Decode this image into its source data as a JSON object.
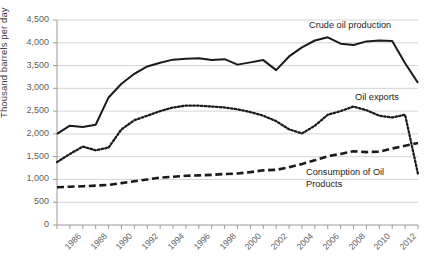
{
  "chart_data": {
    "type": "line",
    "title": "",
    "subtitle": "",
    "xlabel": "",
    "ylabel": "Thousand barrels per day",
    "ylim": [
      0,
      4500
    ],
    "xlim": [
      1985,
      2013
    ],
    "grid": true,
    "legend_position": "inline-annotations",
    "y_ticks": [
      "0",
      "500",
      "1,000",
      "1,500",
      "2,000",
      "2,500",
      "3,000",
      "3,500",
      "4,000",
      "4,500"
    ],
    "y_tick_values": [
      0,
      500,
      1000,
      1500,
      2000,
      2500,
      3000,
      3500,
      4000,
      4500
    ],
    "x_tick_labels": [
      "1986",
      "1988",
      "1990",
      "1992",
      "1994",
      "1996",
      "1998",
      "2000",
      "2002",
      "2004",
      "2006",
      "2008",
      "2010",
      "2012"
    ],
    "x_tick_values": [
      1986,
      1988,
      1990,
      1992,
      1994,
      1996,
      1998,
      2000,
      2002,
      2004,
      2006,
      2008,
      2010,
      2012
    ],
    "x": [
      1985,
      1986,
      1987,
      1988,
      1989,
      1990,
      1991,
      1992,
      1993,
      1994,
      1995,
      1996,
      1997,
      1998,
      1999,
      2000,
      2001,
      2002,
      2003,
      2004,
      2005,
      2006,
      2007,
      2008,
      2009,
      2010,
      2011,
      2012,
      2013
    ],
    "series": [
      {
        "name": "Crude oil production",
        "style": "solid",
        "color": "#1a1a1a",
        "annotation": "Crude oil production",
        "values": [
          2000,
          2180,
          2150,
          2200,
          2800,
          3100,
          3320,
          3480,
          3560,
          3630,
          3650,
          3660,
          3620,
          3640,
          3520,
          3570,
          3620,
          3400,
          3700,
          3900,
          4050,
          4120,
          3980,
          3950,
          4030,
          4050,
          4040,
          3550,
          3120
        ]
      },
      {
        "name": "Oil exports",
        "style": "dotted",
        "color": "#1a1a1a",
        "annotation": "Oil exports",
        "values": [
          1380,
          1560,
          1720,
          1640,
          1700,
          2100,
          2300,
          2400,
          2500,
          2580,
          2620,
          2620,
          2600,
          2580,
          2540,
          2480,
          2400,
          2280,
          2100,
          2010,
          2180,
          2420,
          2500,
          2600,
          2520,
          2400,
          2360,
          2420,
          1120
        ]
      },
      {
        "name": "Consumption of Oil Products",
        "style": "dashed",
        "color": "#1a1a1a",
        "annotation": "Consumption of Oil Products",
        "values": [
          830,
          840,
          850,
          865,
          880,
          920,
          960,
          1000,
          1040,
          1060,
          1080,
          1090,
          1100,
          1120,
          1130,
          1160,
          1200,
          1210,
          1270,
          1340,
          1420,
          1510,
          1560,
          1620,
          1600,
          1610,
          1680,
          1740,
          1800
        ]
      }
    ]
  },
  "annotations": {
    "crude": "Crude oil production",
    "exports": "Oil exports",
    "consumption_line1": "Consumption of Oil",
    "consumption_line2": "Products"
  },
  "axis": {
    "y_title": "Thousand barrels per day"
  },
  "colors": {
    "ink": "#1a1a1a",
    "grid": "#d4d4d4",
    "axis": "#9a9a9a",
    "tick_text": "#5e5e5e"
  }
}
